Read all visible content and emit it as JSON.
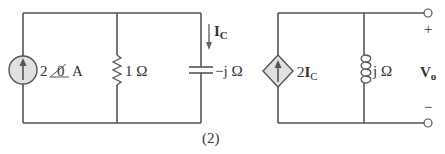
{
  "figure": {
    "caption": "(2)"
  },
  "components": {
    "current_source": {
      "magnitude": "2",
      "angle": "0",
      "unit": "A"
    },
    "resistor": {
      "label": "1 Ω"
    },
    "capacitor": {
      "label": "−j Ω"
    },
    "current_label": {
      "main": "I",
      "sub": "C"
    },
    "dependent_source": {
      "coef": "2",
      "main": "I",
      "sub": "C"
    },
    "inductor": {
      "label": "j Ω"
    },
    "output": {
      "main": "V",
      "sub": "o",
      "plus": "+",
      "minus": "−"
    }
  },
  "colors": {
    "wire": "#555555",
    "source_fill": "#e0e0e0",
    "text": "#333333"
  }
}
